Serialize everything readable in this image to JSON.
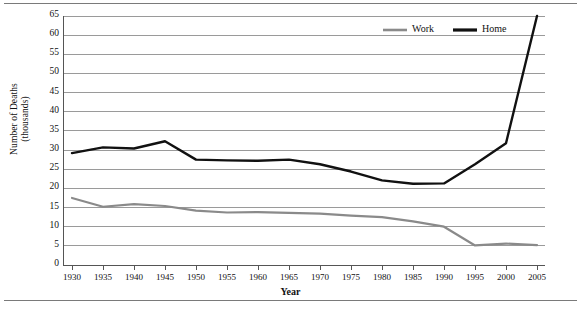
{
  "chart_data": {
    "type": "line",
    "title": "",
    "xlabel": "Year",
    "ylabel": "Number of Deaths (thousands)",
    "ylabel_line1": "Number of Deaths",
    "ylabel_line2": "(thousands)",
    "x": [
      1930,
      1935,
      1940,
      1945,
      1950,
      1955,
      1960,
      1965,
      1970,
      1975,
      1980,
      1985,
      1990,
      1995,
      2000,
      2005
    ],
    "categories": [
      "1930",
      "1935",
      "1940",
      "1945",
      "1950",
      "1955",
      "1960",
      "1965",
      "1970",
      "1975",
      "1980",
      "1985",
      "1990",
      "1995",
      "2000",
      "2005"
    ],
    "xlim": [
      1930,
      2005
    ],
    "ylim": [
      0,
      65
    ],
    "yticks": [
      0,
      5,
      10,
      15,
      20,
      25,
      30,
      35,
      40,
      45,
      50,
      55,
      60,
      65
    ],
    "ytick_labels": [
      "0",
      "5",
      "10",
      "15",
      "20",
      "25",
      "30",
      "35",
      "40",
      "45",
      "50",
      "55",
      "60",
      "65"
    ],
    "grid": true,
    "grid_axis": "y",
    "legend_position": "top-center",
    "series": [
      {
        "name": "Work",
        "color": "#8a8a8a",
        "values": [
          17.5,
          15.2,
          15.9,
          15.4,
          14.2,
          13.7,
          13.8,
          13.6,
          13.4,
          12.9,
          12.5,
          11.4,
          10.0,
          5.1,
          5.6,
          5.2
        ]
      },
      {
        "name": "Home",
        "color": "#111111",
        "values": [
          29.2,
          30.7,
          30.4,
          32.3,
          27.5,
          27.3,
          27.2,
          27.5,
          26.3,
          24.4,
          22.1,
          21.2,
          21.3,
          26.3,
          31.8,
          65.0
        ]
      }
    ]
  },
  "legend": {
    "items": [
      {
        "label": "Work",
        "color": "#8a8a8a"
      },
      {
        "label": "Home",
        "color": "#111111"
      }
    ]
  }
}
